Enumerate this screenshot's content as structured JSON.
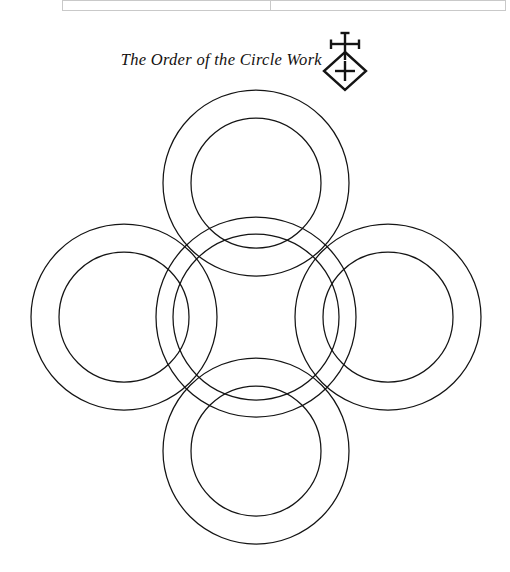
{
  "page": {
    "background_color": "#ffffff",
    "ink_color": "#141414",
    "width": 510,
    "height": 572
  },
  "scan_strip": {
    "name": "scanned-page-edge",
    "rule_color": "#c9c9c9"
  },
  "heading": {
    "title": "The Order of the Circle Work",
    "emblem": {
      "icon_name": "cross-over-diamond-emblem",
      "description": "cross pattée above a diamond enclosing a cross"
    }
  },
  "chart_data": {
    "type": "diagram",
    "title": "The Order of the Circle Work",
    "figure": "quincunx of five concentric circle pairs (annuli) arranged as a cross",
    "stroke_color": "#141414",
    "stroke_width": 1.25,
    "fill": "none",
    "center": {
      "x": 256,
      "y": 317
    },
    "rings": [
      {
        "name": "top-ring",
        "cx": 256,
        "cy": 183,
        "r_outer": 93,
        "r_inner": 65
      },
      {
        "name": "left-ring",
        "cx": 124,
        "cy": 317,
        "r_outer": 93,
        "r_inner": 65
      },
      {
        "name": "right-ring",
        "cx": 388,
        "cy": 317,
        "r_outer": 93,
        "r_inner": 65
      },
      {
        "name": "bottom-ring",
        "cx": 256,
        "cy": 451,
        "r_outer": 93,
        "r_inner": 65
      },
      {
        "name": "center-ring",
        "cx": 256,
        "cy": 317,
        "r_outer": 100,
        "r_inner": 83
      }
    ],
    "ring_count": 5,
    "circle_count": 10
  }
}
